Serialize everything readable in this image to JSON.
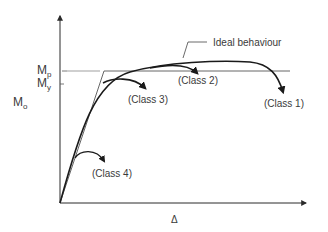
{
  "diagram": {
    "y_axis": {
      "label_main": "M",
      "label_sub": "o"
    },
    "x_axis": {
      "label": "Δ"
    },
    "levels": {
      "plastic": {
        "main": "M",
        "sub": "p"
      },
      "yield": {
        "main": "M",
        "sub": "y"
      }
    },
    "annotations": {
      "ideal": "Ideal behaviour",
      "class1": "(Class 1)",
      "class2": "(Class 2)",
      "class3": "(Class 3)",
      "class4": "(Class 4)"
    },
    "colors": {
      "curve": "#1a1a1a",
      "axis": "#2a2a2a",
      "ideal_line": "#555555",
      "text": "#3a3a3a"
    }
  }
}
